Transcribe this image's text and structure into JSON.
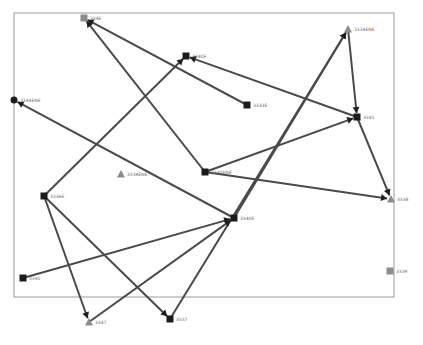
{
  "diagram": {
    "type": "directed-network-graph",
    "node_colors": {
      "dark": "#1c1c1c",
      "gray": "#8c8c8c"
    },
    "nodes": [
      {
        "id": "n1",
        "label": "334E",
        "shape": "square",
        "color": "gray"
      },
      {
        "id": "n2",
        "label": "3340E",
        "shape": "square",
        "color": "dark"
      },
      {
        "id": "n3",
        "label": "3344ENE",
        "shape": "circle",
        "color": "dark"
      },
      {
        "id": "n4",
        "label": "3334ENE",
        "shape": "triangle",
        "color": "gray"
      },
      {
        "id": "n5",
        "label": "3333E",
        "shape": "square",
        "color": "dark"
      },
      {
        "id": "n6",
        "label": "3341",
        "shape": "square",
        "color": "dark"
      },
      {
        "id": "n7",
        "label": "3338ENE",
        "shape": "triangle",
        "color": "gray"
      },
      {
        "id": "n8",
        "label": "3340ENE",
        "shape": "square",
        "color": "dark"
      },
      {
        "id": "n9",
        "label": "3336E",
        "shape": "square",
        "color": "dark"
      },
      {
        "id": "n10",
        "label": "3338",
        "shape": "triangle",
        "color": "gray"
      },
      {
        "id": "n11",
        "label": "3340E",
        "shape": "square",
        "color": "dark"
      },
      {
        "id": "n12",
        "label": "3345",
        "shape": "square",
        "color": "dark"
      },
      {
        "id": "n13",
        "label": "3339",
        "shape": "square",
        "color": "gray"
      },
      {
        "id": "n14",
        "label": "3347",
        "shape": "triangle",
        "color": "gray"
      },
      {
        "id": "n15",
        "label": "3337",
        "shape": "square",
        "color": "dark"
      }
    ],
    "edges": [
      {
        "from": "n5",
        "to": "n1"
      },
      {
        "from": "n8",
        "to": "n1"
      },
      {
        "from": "n6",
        "to": "n2"
      },
      {
        "from": "n9",
        "to": "n2"
      },
      {
        "from": "n11",
        "to": "n3"
      },
      {
        "from": "n4",
        "to": "n6"
      },
      {
        "from": "n8",
        "to": "n6"
      },
      {
        "from": "n11",
        "to": "n4"
      },
      {
        "from": "n15",
        "to": "n4"
      },
      {
        "from": "n6",
        "to": "n10"
      },
      {
        "from": "n8",
        "to": "n10"
      },
      {
        "from": "n9",
        "to": "n14"
      },
      {
        "from": "n9",
        "to": "n15"
      },
      {
        "from": "n12",
        "to": "n11"
      },
      {
        "from": "n14",
        "to": "n11"
      }
    ]
  }
}
